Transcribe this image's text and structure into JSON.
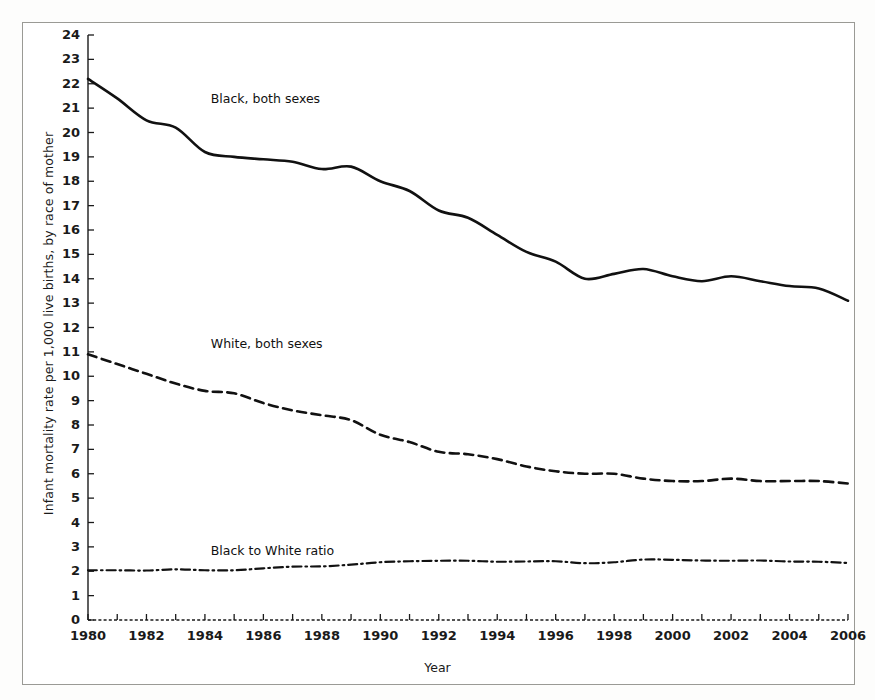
{
  "chart_data": {
    "type": "line",
    "title": "",
    "xlabel": "Year",
    "ylabel": "Infant mortality rate per 1,000 live births, by race of mother",
    "xlim": [
      1980,
      2006
    ],
    "ylim": [
      0,
      24
    ],
    "ytick_step": 1,
    "xtick_step": 1,
    "xtick_label_step": 2,
    "grid": false,
    "legend_position": "inline-annotations",
    "x": [
      1980,
      1981,
      1982,
      1983,
      1984,
      1985,
      1986,
      1987,
      1988,
      1989,
      1990,
      1991,
      1992,
      1993,
      1994,
      1995,
      1996,
      1997,
      1998,
      1999,
      2000,
      2001,
      2002,
      2003,
      2004,
      2005,
      2006
    ],
    "xticks": [
      1980,
      1981,
      1982,
      1983,
      1984,
      1985,
      1986,
      1987,
      1988,
      1989,
      1990,
      1991,
      1992,
      1993,
      1994,
      1995,
      1996,
      1997,
      1998,
      1999,
      2000,
      2001,
      2002,
      2003,
      2004,
      2005,
      2006
    ],
    "xtick_labels": [
      "1980",
      "",
      "1982",
      "",
      "1984",
      "",
      "1986",
      "",
      "1988",
      "",
      "1990",
      "",
      "1992",
      "",
      "1994",
      "",
      "1996",
      "",
      "1998",
      "",
      "2000",
      "",
      "2002",
      "",
      "2004",
      "",
      "2006"
    ],
    "yticks": [
      0,
      1,
      2,
      3,
      4,
      5,
      6,
      7,
      8,
      9,
      10,
      11,
      12,
      13,
      14,
      15,
      16,
      17,
      18,
      19,
      20,
      21,
      22,
      23,
      24
    ],
    "ytick_labels": [
      "0",
      "1",
      "2",
      "3",
      "4",
      "5",
      "6",
      "7",
      "8",
      "9",
      "10",
      "11",
      "12",
      "13",
      "14",
      "15",
      "16",
      "17",
      "18",
      "19",
      "20",
      "21",
      "22",
      "23",
      "24"
    ],
    "series": [
      {
        "name": "Black, both sexes",
        "style": "solid",
        "color": "#111111",
        "width": 2.6,
        "label_x": 1984.2,
        "label_y": 21.35,
        "values": [
          22.2,
          21.4,
          20.5,
          20.2,
          19.2,
          19.0,
          18.9,
          18.8,
          18.5,
          18.6,
          18.0,
          17.6,
          16.8,
          16.5,
          15.8,
          15.1,
          14.7,
          14.0,
          14.2,
          14.4,
          14.1,
          13.9,
          14.1,
          13.9,
          13.7,
          13.6,
          13.1
        ]
      },
      {
        "name": "White, both sexes",
        "style": "dashed",
        "color": "#111111",
        "width": 2.6,
        "label_x": 1984.2,
        "label_y": 11.3,
        "values": [
          10.9,
          10.5,
          10.1,
          9.7,
          9.4,
          9.3,
          8.9,
          8.6,
          8.4,
          8.2,
          7.6,
          7.3,
          6.9,
          6.8,
          6.6,
          6.3,
          6.1,
          6.0,
          6.0,
          5.8,
          5.7,
          5.7,
          5.8,
          5.7,
          5.7,
          5.7,
          5.6
        ]
      },
      {
        "name": "Black to White ratio",
        "style": "dashdot",
        "color": "#111111",
        "width": 2.2,
        "label_x": 1984.2,
        "label_y": 2.78,
        "values": [
          2.04,
          2.04,
          2.03,
          2.08,
          2.04,
          2.04,
          2.12,
          2.19,
          2.2,
          2.27,
          2.37,
          2.41,
          2.43,
          2.43,
          2.39,
          2.4,
          2.41,
          2.33,
          2.37,
          2.48,
          2.47,
          2.44,
          2.43,
          2.44,
          2.4,
          2.39,
          2.34
        ]
      }
    ]
  },
  "figure": {
    "background": "#ffffff",
    "frame_color": "#9a9a95",
    "axis_color": "#1a1a1a"
  }
}
